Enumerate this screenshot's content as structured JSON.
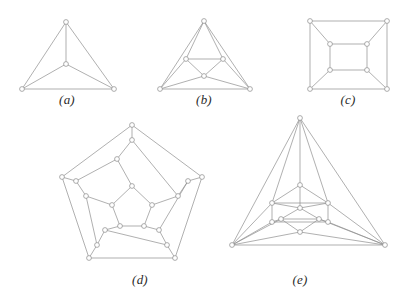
{
  "page": {
    "background_color": "#ffffff",
    "edge_color": "#8e8e8e",
    "node_fill_color": "#ffffff",
    "node_stroke_color": "#8a8a8a",
    "label_color": "#2b2b2b",
    "width": 417,
    "height": 291
  },
  "figures": [
    {
      "id": "a",
      "label": "(a)",
      "name": "tetrahedron-graph",
      "label_x": 67,
      "label_y": 92,
      "vertex_count": 4,
      "edge_count": 6,
      "nodes": [
        [
          66,
          22
        ],
        [
          22,
          89
        ],
        [
          114,
          89
        ],
        [
          66,
          64
        ]
      ],
      "edges": [
        [
          0,
          1
        ],
        [
          0,
          2
        ],
        [
          1,
          2
        ],
        [
          0,
          3
        ],
        [
          1,
          3
        ],
        [
          2,
          3
        ]
      ],
      "node_radius": 2.4
    },
    {
      "id": "b",
      "label": "(b)",
      "name": "octahedron-graph",
      "label_x": 204,
      "label_y": 92,
      "vertex_count": 6,
      "edge_count": 12,
      "nodes": [
        [
          204,
          21
        ],
        [
          160,
          89
        ],
        [
          250,
          89
        ],
        [
          186,
          59
        ],
        [
          223,
          59
        ],
        [
          204,
          76
        ]
      ],
      "edges": [
        [
          0,
          1
        ],
        [
          0,
          2
        ],
        [
          1,
          2
        ],
        [
          3,
          4
        ],
        [
          4,
          5
        ],
        [
          3,
          5
        ],
        [
          0,
          3
        ],
        [
          0,
          4
        ],
        [
          1,
          3
        ],
        [
          1,
          5
        ],
        [
          2,
          4
        ],
        [
          2,
          5
        ]
      ],
      "node_radius": 2.4
    },
    {
      "id": "c",
      "label": "(c)",
      "name": "cube-graph",
      "label_x": 348,
      "label_y": 92,
      "vertex_count": 8,
      "edge_count": 12,
      "nodes": [
        [
          310,
          21
        ],
        [
          387,
          21
        ],
        [
          387,
          89
        ],
        [
          310,
          89
        ],
        [
          330,
          44
        ],
        [
          367,
          44
        ],
        [
          367,
          70
        ],
        [
          330,
          70
        ]
      ],
      "edges": [
        [
          0,
          1
        ],
        [
          1,
          2
        ],
        [
          2,
          3
        ],
        [
          3,
          0
        ],
        [
          4,
          5
        ],
        [
          5,
          6
        ],
        [
          6,
          7
        ],
        [
          7,
          4
        ],
        [
          0,
          4
        ],
        [
          1,
          5
        ],
        [
          2,
          6
        ],
        [
          3,
          7
        ]
      ],
      "node_radius": 2.4
    },
    {
      "id": "d",
      "label": "(d)",
      "name": "dodecahedron-graph",
      "label_x": 140,
      "label_y": 272,
      "vertex_count": 20,
      "edge_count": 30,
      "nodes": [
        [
          132,
          125
        ],
        [
          62,
          177
        ],
        [
          89,
          258
        ],
        [
          175,
          258
        ],
        [
          202,
          177
        ],
        [
          132,
          140
        ],
        [
          76,
          181
        ],
        [
          97,
          245
        ],
        [
          167,
          245
        ],
        [
          188,
          181
        ],
        [
          117,
          159
        ],
        [
          86,
          196
        ],
        [
          105,
          230
        ],
        [
          159,
          230
        ],
        [
          178,
          196
        ],
        [
          132,
          186
        ],
        [
          112,
          205
        ],
        [
          120,
          226
        ],
        [
          144,
          226
        ],
        [
          152,
          205
        ]
      ],
      "edges": [
        [
          0,
          1
        ],
        [
          1,
          2
        ],
        [
          2,
          3
        ],
        [
          3,
          4
        ],
        [
          4,
          0
        ],
        [
          0,
          5
        ],
        [
          1,
          6
        ],
        [
          2,
          7
        ],
        [
          3,
          8
        ],
        [
          4,
          9
        ],
        [
          5,
          10
        ],
        [
          5,
          14
        ],
        [
          6,
          10
        ],
        [
          6,
          11
        ],
        [
          7,
          11
        ],
        [
          7,
          12
        ],
        [
          8,
          12
        ],
        [
          8,
          13
        ],
        [
          9,
          13
        ],
        [
          9,
          14
        ],
        [
          10,
          15
        ],
        [
          11,
          16
        ],
        [
          12,
          17
        ],
        [
          13,
          18
        ],
        [
          14,
          19
        ],
        [
          15,
          16
        ],
        [
          16,
          17
        ],
        [
          17,
          18
        ],
        [
          18,
          19
        ],
        [
          19,
          15
        ]
      ],
      "node_radius": 2.4
    },
    {
      "id": "e",
      "label": "(e)",
      "name": "icosahedron-graph",
      "label_x": 300,
      "label_y": 272,
      "vertex_count": 12,
      "edge_count": 30,
      "nodes": [
        [
          300,
          118
        ],
        [
          232,
          245
        ],
        [
          385,
          245
        ],
        [
          300,
          185
        ],
        [
          272,
          203
        ],
        [
          328,
          203
        ],
        [
          281,
          219
        ],
        [
          319,
          219
        ],
        [
          300,
          232
        ],
        [
          272,
          222
        ],
        [
          328,
          222
        ],
        [
          300,
          208
        ]
      ],
      "edges": [
        [
          0,
          1
        ],
        [
          0,
          2
        ],
        [
          1,
          2
        ],
        [
          0,
          3
        ],
        [
          0,
          4
        ],
        [
          0,
          5
        ],
        [
          1,
          4
        ],
        [
          1,
          9
        ],
        [
          1,
          6
        ],
        [
          1,
          8
        ],
        [
          2,
          5
        ],
        [
          2,
          10
        ],
        [
          2,
          7
        ],
        [
          2,
          8
        ],
        [
          3,
          4
        ],
        [
          3,
          5
        ],
        [
          3,
          11
        ],
        [
          4,
          5
        ],
        [
          4,
          9
        ],
        [
          4,
          11
        ],
        [
          5,
          10
        ],
        [
          5,
          11
        ],
        [
          6,
          9
        ],
        [
          6,
          11
        ],
        [
          6,
          8
        ],
        [
          6,
          7
        ],
        [
          7,
          10
        ],
        [
          7,
          11
        ],
        [
          7,
          8
        ],
        [
          9,
          10
        ]
      ],
      "node_radius": 2.4
    }
  ]
}
